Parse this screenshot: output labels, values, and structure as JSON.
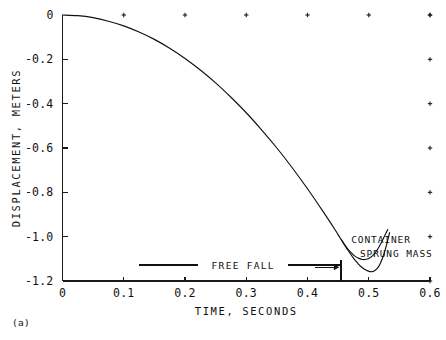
{
  "figure": {
    "panel_label": "(a)",
    "background_color": "#ffffff",
    "ink_color": "#111111"
  },
  "chart_data": {
    "type": "line",
    "title": "",
    "xlabel": "TIME, SECONDS",
    "ylabel": "DISPLACEMENT, METERS",
    "xlim": [
      0,
      0.6
    ],
    "ylim": [
      -1.2,
      0
    ],
    "grid": false,
    "legend_position": "inline-annotation",
    "xticks": [
      0,
      0.1,
      0.2,
      0.3,
      0.4,
      0.5,
      0.6
    ],
    "xtick_labels": [
      "0",
      "0.1",
      "0.2",
      "0.3",
      "0.4",
      "0.5",
      "0.6"
    ],
    "yticks": [
      0,
      -0.2,
      -0.4,
      -0.6,
      -0.8,
      -1.0,
      -1.2
    ],
    "ytick_labels": [
      "0",
      "-0.2",
      "-0.4",
      "-0.6",
      "-0.8",
      "-1.0",
      "-1.2"
    ],
    "top_edge_ticks": [
      0.1,
      0.2,
      0.3,
      0.4,
      0.5,
      0.6
    ],
    "right_edge_ticks": [
      0,
      -0.2,
      -0.4,
      -0.6,
      -0.8,
      -1.0,
      -1.2
    ],
    "series": [
      {
        "name": "CONTAINER",
        "label_x": 0.52,
        "label_y": -1.03,
        "x": [
          0.0,
          0.025,
          0.05,
          0.075,
          0.1,
          0.125,
          0.15,
          0.175,
          0.2,
          0.225,
          0.25,
          0.275,
          0.3,
          0.325,
          0.35,
          0.375,
          0.4,
          0.425,
          0.445,
          0.455,
          0.465,
          0.472,
          0.478,
          0.484,
          0.49,
          0.496,
          0.502,
          0.508,
          0.514,
          0.52,
          0.526,
          0.531
        ],
        "y": [
          0.0,
          -0.003,
          -0.012,
          -0.028,
          -0.049,
          -0.077,
          -0.11,
          -0.15,
          -0.196,
          -0.248,
          -0.306,
          -0.371,
          -0.441,
          -0.518,
          -0.6,
          -0.689,
          -0.784,
          -0.885,
          -0.969,
          -1.013,
          -1.053,
          -1.074,
          -1.089,
          -1.098,
          -1.103,
          -1.102,
          -1.095,
          -1.081,
          -1.059,
          -1.03,
          -0.996,
          -0.968
        ]
      },
      {
        "name": "SPRUNG MASS",
        "label_x": 0.545,
        "label_y": -1.09,
        "x": [
          0.455,
          0.465,
          0.475,
          0.482,
          0.489,
          0.496,
          0.502,
          0.508,
          0.514,
          0.519,
          0.524,
          0.529,
          0.534
        ],
        "y": [
          -1.013,
          -1.057,
          -1.097,
          -1.12,
          -1.139,
          -1.152,
          -1.158,
          -1.156,
          -1.143,
          -1.12,
          -1.085,
          -1.038,
          -0.982
        ]
      }
    ],
    "annotations": [
      {
        "name": "free-fall",
        "text": "FREE FALL",
        "x": 0.295,
        "y": -1.128,
        "rule_left": [
          0.125,
          0.222
        ],
        "rule_right": [
          0.368,
          0.455
        ]
      },
      {
        "name": "impact-marker",
        "text": "",
        "x": 0.455,
        "y_top": -1.105,
        "y_bottom": -1.2,
        "arrow_from": 0.413,
        "arrow_to": 0.452,
        "arrow_y": -1.138
      }
    ]
  }
}
